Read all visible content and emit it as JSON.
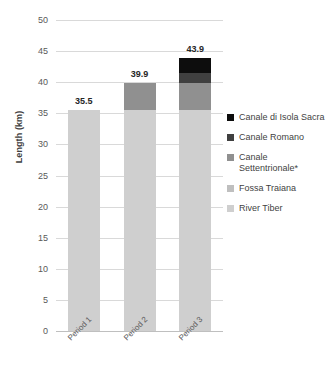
{
  "chart_data": {
    "type": "bar",
    "subtype": "stacked-bar",
    "title": "",
    "xlabel": "",
    "ylabel": "Length (km)",
    "ylim": [
      0,
      50
    ],
    "ytick_step": 5,
    "yticks": [
      "0",
      "5",
      "10",
      "15",
      "20",
      "25",
      "30",
      "35",
      "40",
      "45",
      "50"
    ],
    "grid": true,
    "legend_position": "right",
    "categories": [
      "Period 1",
      "Period 2",
      "Period 3"
    ],
    "series": [
      {
        "name": "River Tiber",
        "color": "#cfcfcf",
        "values": [
          35.5,
          35.5,
          35.5
        ]
      },
      {
        "name": "Fossa Traiana",
        "color": "#bfbfbf",
        "values": [
          0,
          0,
          0
        ]
      },
      {
        "name": "Canale Settentrionale*",
        "color": "#909090",
        "values": [
          0,
          4.4,
          4.4
        ]
      },
      {
        "name": "Canale Romano",
        "color": "#404040",
        "values": [
          0,
          0,
          1.6
        ]
      },
      {
        "name": "Canale di Isola Sacra",
        "color": "#0d0d0d",
        "values": [
          0,
          0,
          2.4
        ]
      }
    ],
    "totals": [
      "35.5",
      "39.9",
      "43.9"
    ],
    "total_values": [
      35.5,
      39.9,
      43.9
    ]
  },
  "legend": {
    "items": [
      {
        "label": "Canale di Isola Sacra",
        "color": "#0d0d0d"
      },
      {
        "label": "Canale Romano",
        "color": "#404040"
      },
      {
        "label": "Canale Settentrionale*",
        "color": "#909090"
      },
      {
        "label": "Fossa Traiana",
        "color": "#bfbfbf"
      },
      {
        "label": "River Tiber",
        "color": "#cfcfcf"
      }
    ]
  },
  "axis": {
    "y_title": "Length (km)"
  }
}
